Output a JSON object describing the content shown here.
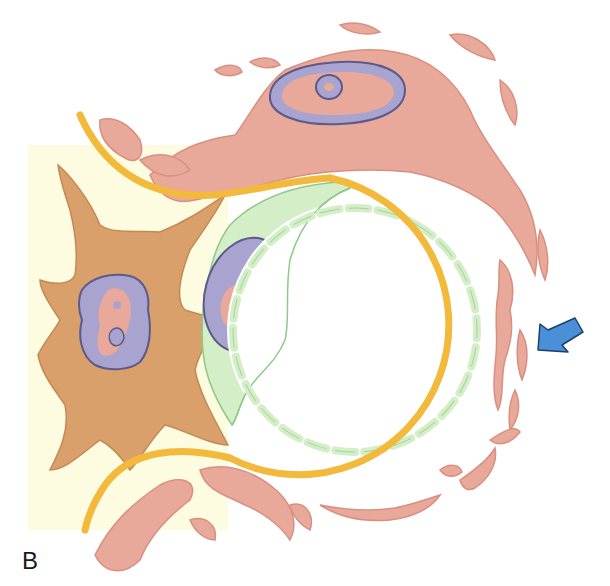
{
  "figure": {
    "panel_label": "B",
    "colors": {
      "background_tint": "#fdfbe0",
      "yellow_membrane": "#f3b93a",
      "pink_tissue": "#e8a99a",
      "pink_outline": "#d98f80",
      "orange_cell": "#d9a06b",
      "orange_outline": "#c68852",
      "nucleus_fill": "#a9a4cf",
      "nucleus_outline": "#5b5a8a",
      "green_cell": "#d4efc8",
      "green_outline": "#8ec98a",
      "arrow_fill": "#4a90d9",
      "arrow_outline": "#1f3f66"
    },
    "elements": [
      "pericyte-orange-cell",
      "endothelial-green-cell",
      "capillary-lumen",
      "basement-membrane-yellow",
      "surrounding-pink-tissue",
      "blue-arrow-indicator"
    ]
  }
}
